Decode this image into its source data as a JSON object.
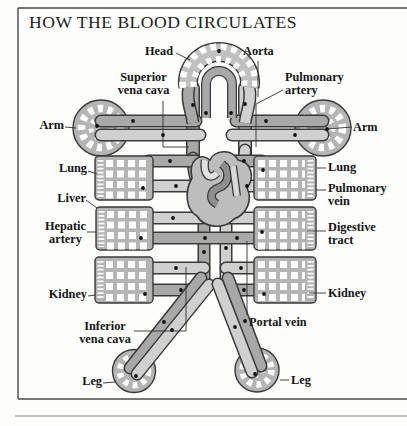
{
  "title": "HOW THE BLOOD CIRCULATES",
  "labels": {
    "head": "Head",
    "aorta": "Aorta",
    "superior_vena_cava": "Superior\nvena cava",
    "pulmonary_artery": "Pulmonary\nartery",
    "arm_left": "Arm",
    "arm_right": "Arm",
    "lung_left": "Lung",
    "lung_right": "Lung",
    "pulmonary_vein": "Pulmonary\nvein",
    "liver": "Liver",
    "hepatic_artery": "Hepatic\nartery",
    "digestive_tract": "Digestive\ntract",
    "kidney_left": "Kidney",
    "kidney_right": "Kidney",
    "inferior_vena_cava": "Inferior\nvena cava",
    "portal_vein": "Portal vein",
    "leg_left": "Leg",
    "leg_right": "Leg"
  },
  "colors": {
    "artery_tube": "#d0d0d0",
    "vein_tube": "#a8a8a8",
    "capillary_bed": "#b4b4b4",
    "outline": "#3a3a3a",
    "heart": "#bdbdbd",
    "background": "#fdfdfb"
  }
}
